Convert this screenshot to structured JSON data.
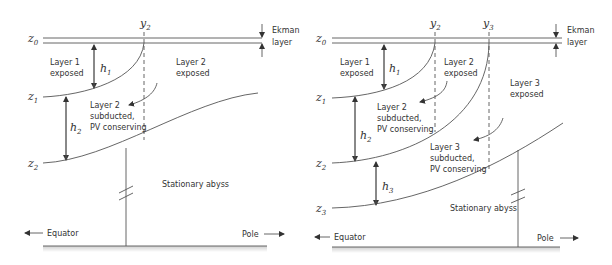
{
  "panels": [
    {
      "id": "two-layer",
      "surface_label": "z",
      "surface_sub": "0",
      "interfaces": [
        {
          "sym": "z",
          "sub": "1"
        },
        {
          "sym": "z",
          "sub": "2"
        }
      ],
      "outcrops": [
        {
          "sym": "y",
          "sub": "2"
        }
      ],
      "thicknesses": [
        {
          "sym": "h",
          "sub": "1"
        },
        {
          "sym": "h",
          "sub": "2"
        }
      ],
      "regions": {
        "layer1_exposed": [
          "Layer 1",
          "exposed"
        ],
        "layer2_exposed": [
          "Layer 2",
          "exposed"
        ],
        "layer2_subducted": [
          "Layer 2",
          "subducted,",
          "PV conserving"
        ],
        "abyss": "Stationary abyss"
      },
      "ekman": [
        "Ekman",
        "layer"
      ],
      "equator": "Equator",
      "pole": "Pole"
    },
    {
      "id": "three-layer",
      "surface_label": "z",
      "surface_sub": "0",
      "interfaces": [
        {
          "sym": "z",
          "sub": "1"
        },
        {
          "sym": "z",
          "sub": "2"
        },
        {
          "sym": "z",
          "sub": "3"
        }
      ],
      "outcrops": [
        {
          "sym": "y",
          "sub": "2"
        },
        {
          "sym": "y",
          "sub": "3"
        }
      ],
      "thicknesses": [
        {
          "sym": "h",
          "sub": "1"
        },
        {
          "sym": "h",
          "sub": "2"
        },
        {
          "sym": "h",
          "sub": "3"
        }
      ],
      "regions": {
        "layer1_exposed": [
          "Layer 1",
          "exposed"
        ],
        "layer2_exposed": [
          "Layer 2",
          "exposed"
        ],
        "layer3_exposed": [
          "Layer 3",
          "exposed"
        ],
        "layer2_subducted": [
          "Layer 2",
          "subducted,",
          "PV conserving"
        ],
        "layer3_subducted": [
          "Layer 3",
          "subducted,",
          "PV conserving"
        ],
        "abyss": "Stationary abyss"
      },
      "ekman": [
        "Ekman",
        "layer"
      ],
      "equator": "Equator",
      "pole": "Pole"
    }
  ]
}
